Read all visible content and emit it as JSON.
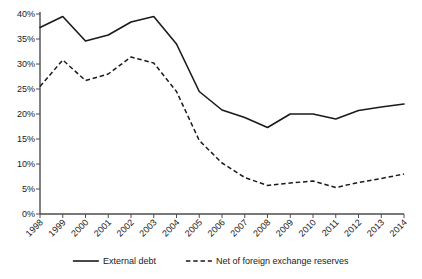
{
  "chart_data": {
    "type": "line",
    "title": "",
    "subtitle": "",
    "xlabel": "",
    "ylabel": "",
    "grid": false,
    "legend_position": "bottom",
    "ylim": [
      0,
      40
    ],
    "ytick_labels": [
      "0%",
      "5%",
      "10%",
      "15%",
      "20%",
      "25%",
      "30%",
      "35%",
      "40%"
    ],
    "ytick_values": [
      0,
      5,
      10,
      15,
      20,
      25,
      30,
      35,
      40
    ],
    "categories": [
      "1998",
      "1999",
      "2000",
      "2001",
      "2002",
      "2003",
      "2004",
      "2005",
      "2006",
      "2007",
      "2008",
      "2009",
      "2010",
      "2011",
      "2012",
      "2013",
      "2014"
    ],
    "x": [
      1998,
      1999,
      2000,
      2001,
      2002,
      2003,
      2004,
      2005,
      2006,
      2007,
      2008,
      2009,
      2010,
      2011,
      2012,
      2013,
      2014
    ],
    "series": [
      {
        "name": "External debt",
        "style": "solid",
        "color": "#1a1a1a",
        "values": [
          37.3,
          39.5,
          34.6,
          35.8,
          38.4,
          39.5,
          34.0,
          24.5,
          20.8,
          19.3,
          17.3,
          20.0,
          20.0,
          19.0,
          20.7,
          21.4,
          22.0
        ]
      },
      {
        "name": "Net of foreign exchange reserves",
        "style": "dashed",
        "color": "#1a1a1a",
        "values": [
          25.5,
          30.8,
          26.7,
          28.0,
          31.4,
          30.2,
          24.5,
          14.7,
          10.2,
          7.3,
          5.7,
          6.2,
          6.6,
          5.3,
          6.3,
          7.1,
          8.0
        ]
      }
    ]
  },
  "legend": {
    "items": [
      {
        "label": "External debt",
        "style": "solid"
      },
      {
        "label": "Net of foreign exchange reserves",
        "style": "dashed"
      }
    ]
  }
}
